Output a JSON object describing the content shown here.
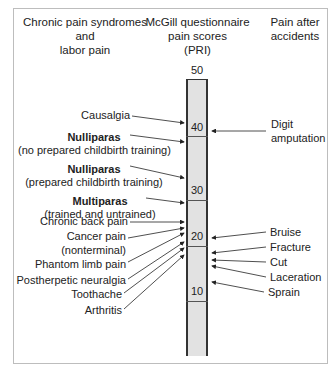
{
  "headers": {
    "left": [
      "Chronic pain syndromes",
      "and",
      "labor pain"
    ],
    "center": [
      "McGill questionnaire",
      "pain scores",
      "(PRI)"
    ],
    "right": [
      "Pain after",
      "accidents"
    ]
  },
  "scale": {
    "top_label": "50",
    "ticks": [
      {
        "value": "40",
        "y": 128
      },
      {
        "value": "30",
        "y": 191
      },
      {
        "value": "20",
        "y": 245
      },
      {
        "value": "10",
        "y": 300
      }
    ],
    "bar_color": "#e2e2e2",
    "border_color": "#333333"
  },
  "left_items": [
    {
      "bold": "",
      "text": "Causalgia"
    },
    {
      "bold": "Nulliparas",
      "text": "(no prepared childbirth training)"
    },
    {
      "bold": "Nulliparas",
      "text": "(prepared childbirth training)"
    },
    {
      "bold": "Multiparas",
      "text": "(trained and untrained)"
    },
    {
      "bold": "",
      "text": "Chronic back pain"
    },
    {
      "bold": "",
      "text": "Cancer pain"
    },
    {
      "bold": "",
      "text": "(nonterminal)"
    },
    {
      "bold": "",
      "text": "Phantom limb pain"
    },
    {
      "bold": "",
      "text": "Postherpetic neuralgia"
    },
    {
      "bold": "",
      "text": "Toothache"
    },
    {
      "bold": "",
      "text": "Arthritis"
    }
  ],
  "right_items": [
    {
      "text": "Digit"
    },
    {
      "text": "amputation"
    },
    {
      "text": "Bruise"
    },
    {
      "text": "Fracture"
    },
    {
      "text": "Cut"
    },
    {
      "text": "Laceration"
    },
    {
      "text": "Sprain"
    }
  ]
}
